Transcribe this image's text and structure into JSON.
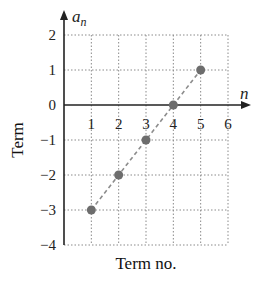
{
  "chart_data": {
    "type": "scatter",
    "title": "",
    "xlabel": "Term no.",
    "ylabel": "Term",
    "x_axis_name": "n",
    "y_axis_name": "a",
    "y_axis_name_sub": "n",
    "xlim": [
      0,
      6
    ],
    "ylim": [
      -4,
      2
    ],
    "grid": true,
    "x_ticks": [
      "1",
      "2",
      "3",
      "4",
      "5",
      "6"
    ],
    "y_ticks": [
      "2",
      "1",
      "0",
      "−1",
      "−2",
      "−3",
      "−4"
    ],
    "y_tick_values": [
      2,
      1,
      0,
      -1,
      -2,
      -3,
      -4
    ],
    "x_tick_values": [
      1,
      2,
      3,
      4,
      5,
      6
    ],
    "series": [
      {
        "name": "a_n",
        "x": [
          1,
          2,
          3,
          4,
          5
        ],
        "y": [
          -3,
          -2,
          -1,
          0,
          1
        ],
        "marker": "circle",
        "color": "#6d6d6d",
        "connected": "dashed"
      }
    ]
  }
}
